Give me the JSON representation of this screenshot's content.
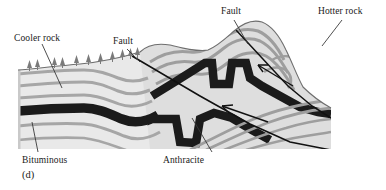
{
  "figure": {
    "caption": "(d)",
    "panel_letter": "d"
  },
  "labels": {
    "cooler_rock": "Cooler rock",
    "fault_left": "Fault",
    "fault_top": "Fault",
    "hotter_rock": "Hotter rock",
    "bituminous": "Bituminous",
    "anthracite": "Anthracite"
  },
  "colors": {
    "background": "#ffffff",
    "rock_light": "#e9e9e9",
    "rock_mid": "#d2d2d2",
    "strata_band": "#a6a6a6",
    "strata_band_dark": "#8f8f8f",
    "coal_seam": "#1b1b1b",
    "fault_line": "#111111",
    "leader_line": "#3a3a3a",
    "tree": "#7a7a7a",
    "text": "#1a1a1a"
  },
  "diagram_data": {
    "type": "cross-section",
    "block": {
      "left": 18,
      "top": 22,
      "right": 331,
      "bottom": 149
    },
    "coal_seams": [
      {
        "name": "Bituminous",
        "region": "left-cooler",
        "grade": "bituminous"
      },
      {
        "name": "Anthracite",
        "region": "right-hotter-folded",
        "grade": "anthracite"
      }
    ],
    "faults": [
      {
        "name": "Fault",
        "position": "left-center",
        "type": "thrust"
      },
      {
        "name": "Fault",
        "position": "upper-right",
        "type": "thrust"
      }
    ],
    "thermal_gradient": {
      "left": "Cooler rock",
      "right": "Hotter rock"
    },
    "surface_features": "conifer-trees-on-left-plain",
    "strata_count": 6
  }
}
